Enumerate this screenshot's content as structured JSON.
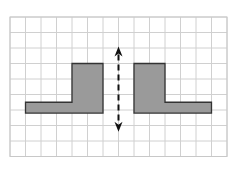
{
  "diagram": {
    "type": "reflection-symmetry-grid",
    "grid": {
      "origin_x": 10,
      "origin_y": 17,
      "cell_size": 15.5,
      "columns": 14,
      "rows": 9,
      "line_color": "#d0d0d0",
      "border_color": "#c8c8c8"
    },
    "shapes": [
      {
        "name": "left-l-shape",
        "fill": "#9a9a9a",
        "stroke": "#333333",
        "points_grid": [
          [
            1,
            5.5
          ],
          [
            4,
            5.5
          ],
          [
            4,
            3
          ],
          [
            6,
            3
          ],
          [
            6,
            6.2
          ],
          [
            1,
            6.2
          ]
        ]
      },
      {
        "name": "right-l-shape",
        "fill": "#9a9a9a",
        "stroke": "#333333",
        "points_grid": [
          [
            8,
            3
          ],
          [
            10,
            3
          ],
          [
            10,
            5.5
          ],
          [
            13,
            5.5
          ],
          [
            13,
            6.2
          ],
          [
            8,
            6.2
          ]
        ]
      }
    ],
    "mirror_line": {
      "x_grid": 7,
      "y_start_grid": 1.9,
      "y_end_grid": 7.4,
      "color": "#111111",
      "dashed": true,
      "arrows": "both"
    }
  }
}
